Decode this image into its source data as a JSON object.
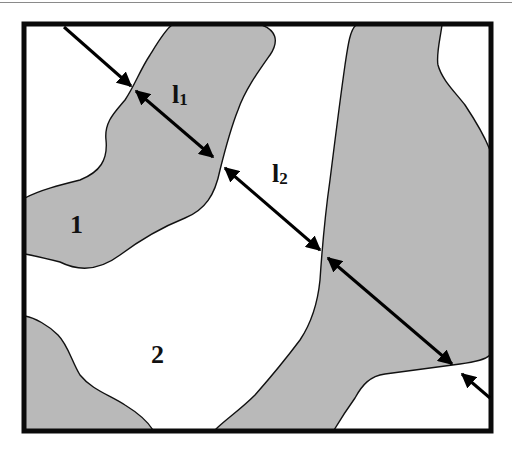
{
  "figure": {
    "type": "two-phase microstructure schematic",
    "colors": {
      "phase_fill": "#b9b9b9",
      "background": "#ffffff",
      "outline": "#111111",
      "frame": "#0a0a0a"
    },
    "labels": {
      "phase1": "1",
      "phase2": "2",
      "l1_main": "l",
      "l1_sub": "1",
      "l2_main": "l",
      "l2_sub": "2"
    },
    "annotations": [
      {
        "id": "l1",
        "description": "chord length through phase 1 (gray grain)"
      },
      {
        "id": "l2",
        "description": "chord length through phase 2 (white matrix)"
      }
    ]
  }
}
